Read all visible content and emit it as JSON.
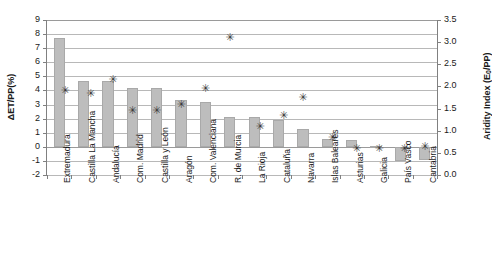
{
  "chart_data": {
    "type": "bar",
    "title": "",
    "xlabel": "",
    "ylabel": "ΔET/PP(%)",
    "ylabel_secondary": "Aridity Index (E₀/PP)",
    "ylim": [
      -2,
      9
    ],
    "ylim_secondary": [
      0.0,
      3.5
    ],
    "grid": true,
    "legend": "none",
    "categories": [
      "Extremadura",
      "Castilla La Mancha",
      "Andalucía",
      "Com. Madrid",
      "Castilla y León",
      "Aragón",
      "Com. Valenciana",
      "R. de Murcia",
      "La Rioja",
      "Cataluña",
      "Navarra",
      "Islas Baleares",
      "Asturias",
      "Galicia",
      "País Vasco",
      "Cantabria"
    ],
    "series": [
      {
        "name": "ΔET/PP(%)",
        "axis": "left",
        "render": "bar",
        "color": "#bdbdbd",
        "values": [
          7.7,
          4.7,
          4.7,
          4.2,
          4.2,
          3.3,
          3.2,
          2.1,
          2.15,
          1.9,
          1.3,
          0.55,
          0.45,
          0.05,
          -1.0,
          -0.95
        ]
      },
      {
        "name": "Aridity Index (E₀/PP)",
        "axis": "right",
        "render": "marker",
        "marker": "✳",
        "color": "#3a3a3a",
        "values": [
          1.9,
          1.85,
          2.15,
          1.45,
          1.45,
          1.6,
          1.95,
          3.1,
          1.1,
          1.35,
          1.75,
          0.85,
          0.6,
          0.6,
          0.6,
          0.65
        ]
      }
    ],
    "yticks_left": [
      "9",
      "8",
      "7",
      "6",
      "5",
      "4",
      "3",
      "2",
      "1",
      "0",
      "-1",
      "-2"
    ],
    "yticks_right": [
      "3.5",
      "3.0",
      "2.5",
      "2.0",
      "1.5",
      "1.0",
      "0.5",
      "0.0"
    ]
  },
  "axes": {
    "left_title": "ΔET/PP(%)",
    "right_title_main": "Aridity Index (E",
    "right_title_sub": "0",
    "right_title_tail": "/PP)"
  }
}
